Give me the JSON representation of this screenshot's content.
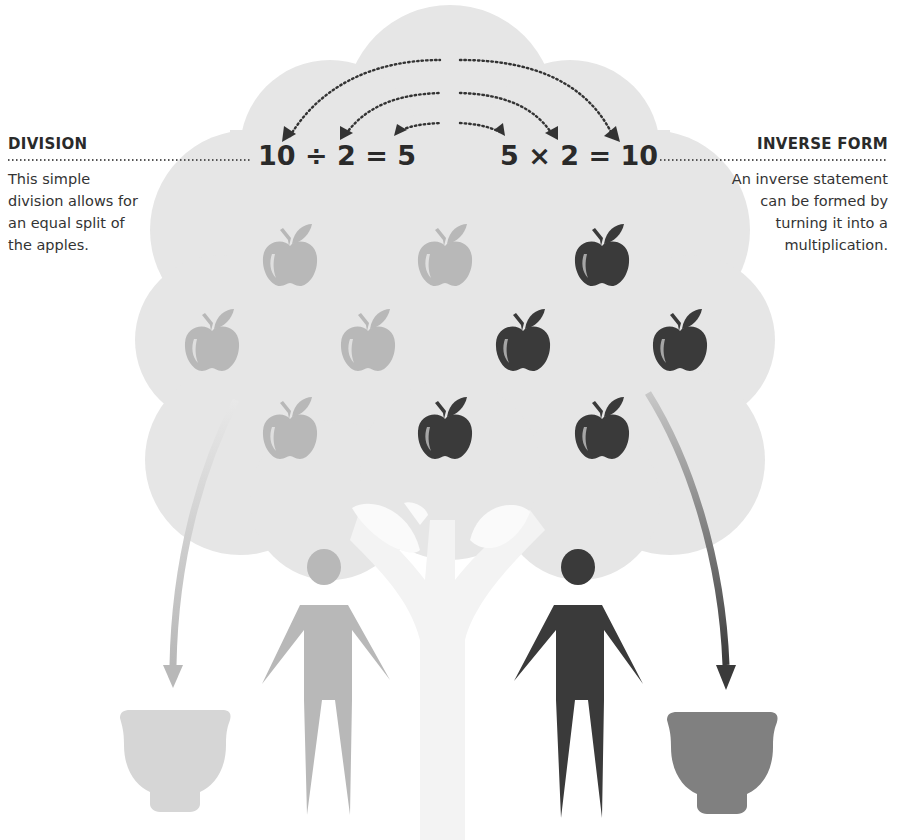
{
  "left_annotation": {
    "title": "DIVISION",
    "body": "This simple division allows for an equal split of the apples."
  },
  "right_annotation": {
    "title": "INVERSE FORM",
    "body": "An inverse statement can be formed by turning it into a multiplication."
  },
  "equations": {
    "division": "10 ÷ 2 = 5",
    "multiplication": "5 × 2 = 10"
  },
  "colors": {
    "canopy": "#e6e6e6",
    "trunk": "#f1f1f1",
    "light_group": "#b8b8b8",
    "dark_group": "#3a3a3a",
    "light_bowl": "#d6d6d6",
    "dark_bowl": "#808080",
    "text": "#2a2a2a"
  },
  "apples": {
    "total": 10,
    "light_count": 5,
    "dark_count": 5,
    "rows": [
      [
        "light",
        "light",
        "dark"
      ],
      [
        "light",
        "light",
        "dark",
        "dark"
      ],
      [
        "light",
        "dark",
        "dark"
      ]
    ]
  },
  "people": [
    {
      "group": "light"
    },
    {
      "group": "dark"
    }
  ],
  "bowls": [
    {
      "group": "light"
    },
    {
      "group": "dark"
    }
  ]
}
